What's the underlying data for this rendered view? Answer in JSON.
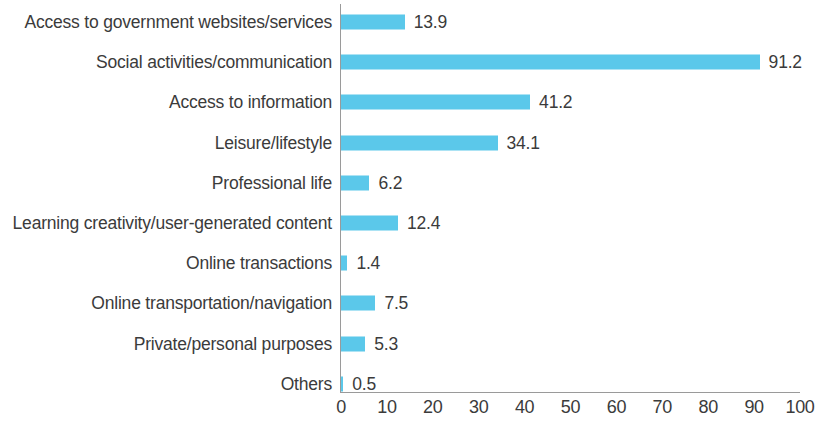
{
  "chart_data": {
    "type": "bar",
    "orientation": "horizontal",
    "title": "",
    "subtitle": "",
    "xlabel": "",
    "ylabel": "",
    "xlim": [
      0,
      100
    ],
    "grid": false,
    "legend": null,
    "bar_color": "#5bc8ea",
    "text_color": "#3b3b3b",
    "axis_color": "#9a9a9a",
    "background_color": "#ffffff",
    "xticks": [
      "0",
      "10",
      "20",
      "30",
      "40",
      "50",
      "60",
      "70",
      "80",
      "90",
      "100"
    ],
    "xtick_values": [
      0,
      10,
      20,
      30,
      40,
      50,
      60,
      70,
      80,
      90,
      100
    ],
    "categories": [
      "Access to government websites/services",
      "Social activities/communication",
      "Access to information",
      "Leisure/lifestyle",
      "Professional life",
      "Learning creativity/user-generated content",
      "Online transactions",
      "Online transportation/navigation",
      "Private/personal purposes",
      "Others"
    ],
    "values": [
      13.9,
      91.2,
      41.2,
      34.1,
      6.2,
      12.4,
      1.4,
      7.5,
      5.3,
      0.5
    ],
    "value_labels": [
      "13.9",
      "91.2",
      "41.2",
      "34.1",
      "6.2",
      "12.4",
      "1.4",
      "7.5",
      "5.3",
      "0.5"
    ]
  }
}
